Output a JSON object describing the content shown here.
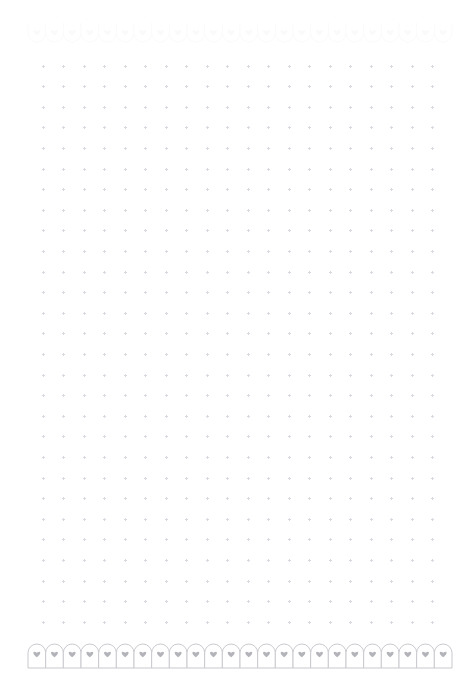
{
  "page": {
    "title": "Dot Grid Notebook Page",
    "width": 476,
    "height": 693,
    "background_color": "#ffffff",
    "orientation": "portrait"
  },
  "dot_grid": {
    "name": "dot-grid",
    "columns": 20,
    "rows": 28,
    "spacing_x": 20.5,
    "spacing_y": 20.6,
    "origin_x": 43,
    "origin_y": 66,
    "dot_color": "#d9d9e0",
    "dot_shape": "plus-mark",
    "dot_size": 3
  },
  "borders": {
    "top": {
      "name": "top-decorative-border",
      "motif": "arch-with-heart",
      "orientation": "inverted",
      "count": 24,
      "start_x": 28,
      "end_x": 452,
      "y": 26,
      "arch_width": 17.7,
      "arch_height": 20,
      "stroke_color": "#fbfbfc",
      "heart_color": "#fafafb",
      "fill_color": "#ffffff"
    },
    "bottom": {
      "name": "bottom-decorative-border",
      "motif": "arch-with-heart",
      "orientation": "upright",
      "count": 24,
      "start_x": 28,
      "end_x": 452,
      "y": 644,
      "arch_width": 17.7,
      "arch_height": 24,
      "stroke_color": "#c9c9cf",
      "heart_color": "#b3b3ba",
      "fill_color": "#ffffff",
      "baseline_color": "#c9c9cf"
    }
  }
}
